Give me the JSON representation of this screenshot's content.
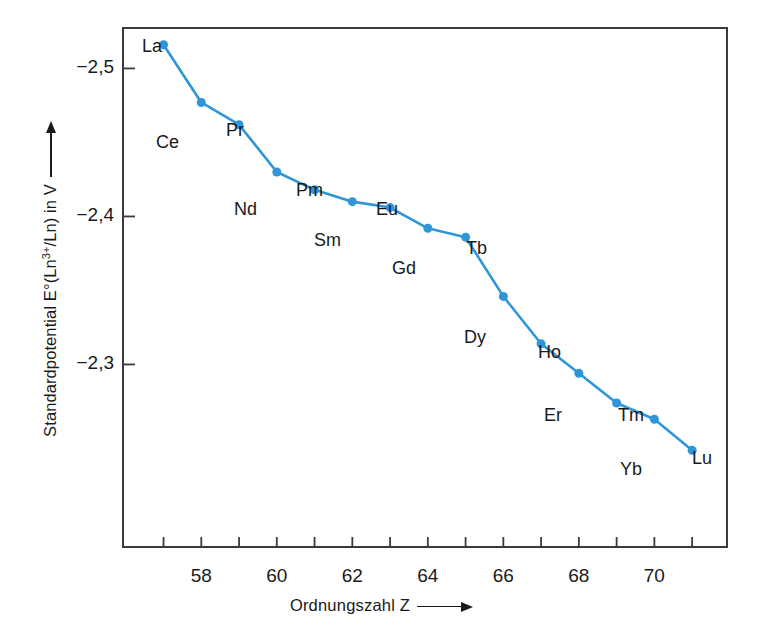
{
  "chart_data": {
    "type": "line",
    "title": "",
    "xlabel": "Ordnungszahl  Z",
    "ylabel": "Standardpotential E°(Ln3+/Ln) in V",
    "ylabel_parts": {
      "prefix": "Standardpotential E°(Ln",
      "superscript": "3+",
      "suffix": "/Ln) in V"
    },
    "x": [
      57,
      58,
      59,
      60,
      61,
      62,
      63,
      64,
      65,
      66,
      67,
      68,
      69,
      70,
      71
    ],
    "values": [
      -2.516,
      -2.477,
      -2.462,
      -2.43,
      -2.418,
      -2.41,
      -2.406,
      -2.392,
      -2.386,
      -2.346,
      -2.314,
      -2.294,
      -2.274,
      -2.263,
      -2.242
    ],
    "point_labels": [
      "La",
      "Ce",
      "Pr",
      "Nd",
      "Pm",
      "Sm",
      "Eu",
      "Gd",
      "Tb",
      "Dy",
      "Ho",
      "Er",
      "Tm",
      "Yb",
      "Lu"
    ],
    "xlim": [
      55.9,
      71.95
    ],
    "ylim": [
      -2.528,
      -2.176
    ],
    "y_inverted": true,
    "xticks": [
      58,
      60,
      62,
      64,
      66,
      68,
      70
    ],
    "xticks_minor": [
      57,
      59,
      61,
      63,
      65,
      67,
      69,
      71
    ],
    "xtick_labels": [
      "58",
      "60",
      "62",
      "64",
      "66",
      "68",
      "70"
    ],
    "yticks": [
      -2.5,
      -2.4,
      -2.3
    ],
    "ytick_labels": [
      "−2,5",
      "−2,4",
      "−2,3"
    ],
    "grid": false,
    "legend": null,
    "series_color": "#2e96d8",
    "axis_color": "#3a3a3a",
    "marker": "circle",
    "marker_size": 9,
    "line_width": 2.6
  },
  "point_label_offsets": [
    {
      "label": "La",
      "x": 142,
      "y": 36
    },
    {
      "label": "Ce",
      "x": 156,
      "y": 132
    },
    {
      "label": "Pr",
      "x": 226,
      "y": 120
    },
    {
      "label": "Nd",
      "x": 234,
      "y": 199
    },
    {
      "label": "Pm",
      "x": 296,
      "y": 180
    },
    {
      "label": "Sm",
      "x": 314,
      "y": 230
    },
    {
      "label": "Eu",
      "x": 376,
      "y": 199
    },
    {
      "label": "Gd",
      "x": 392,
      "y": 258
    },
    {
      "label": "Tb",
      "x": 466,
      "y": 238
    },
    {
      "label": "Dy",
      "x": 464,
      "y": 327
    },
    {
      "label": "Ho",
      "x": 538,
      "y": 342
    },
    {
      "label": "Er",
      "x": 544,
      "y": 405
    },
    {
      "label": "Tm",
      "x": 618,
      "y": 405
    },
    {
      "label": "Yb",
      "x": 620,
      "y": 459
    },
    {
      "label": "Lu",
      "x": 692,
      "y": 448
    }
  ]
}
